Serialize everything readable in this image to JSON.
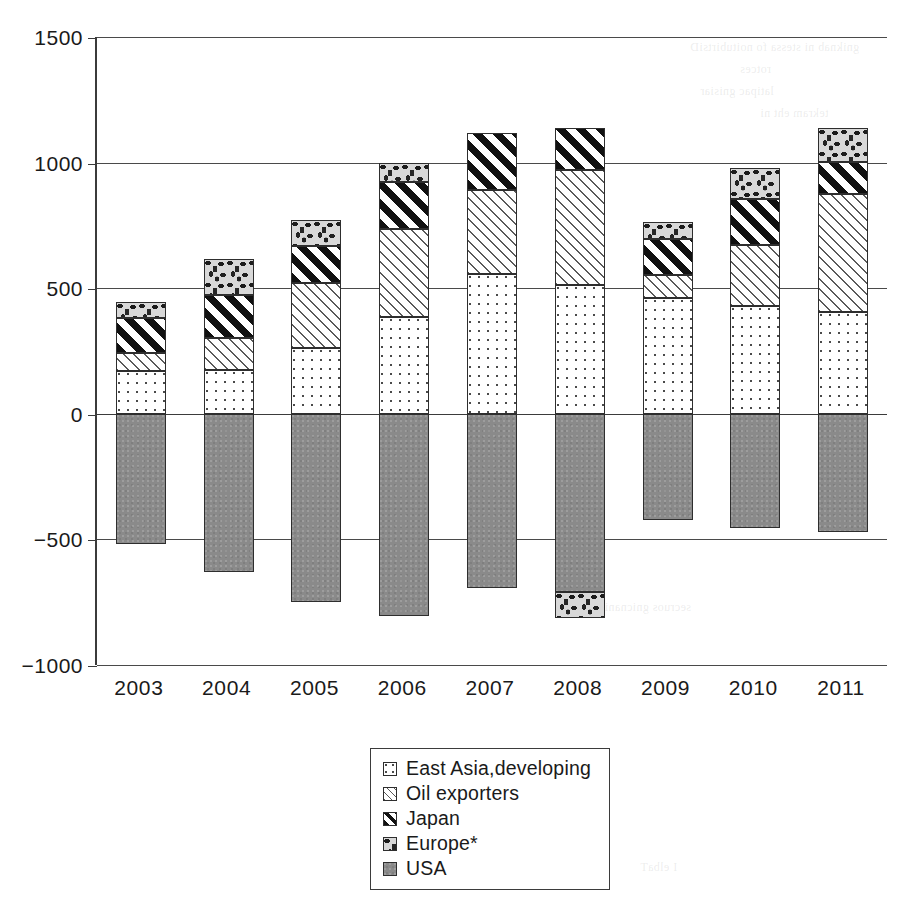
{
  "chart_data": {
    "type": "bar",
    "stacked": true,
    "title": "",
    "xlabel": "",
    "ylabel": "",
    "ylim": [
      -1000,
      1500
    ],
    "ytick_values": [
      1500,
      1000,
      500,
      0,
      -500,
      -1000
    ],
    "ytick_labels": [
      "1500",
      "1000",
      "500",
      "0",
      "−500",
      "−1000"
    ],
    "grid": true,
    "legend_position": "bottom-center",
    "categories": [
      "2003",
      "2004",
      "2005",
      "2006",
      "2007",
      "2008",
      "2009",
      "2010",
      "2011"
    ],
    "series": [
      {
        "name": "East Asia,developing",
        "pattern": "dotted",
        "values": [
          170,
          175,
          260,
          387,
          558,
          514,
          459,
          430,
          406
        ]
      },
      {
        "name": "Oil exporters",
        "pattern": "light-diagonal-hatch",
        "values": [
          72,
          125,
          259,
          349,
          334,
          458,
          92,
          240,
          470
        ]
      },
      {
        "name": "Japan",
        "pattern": "bold-diagonal-hatch",
        "values": [
          139,
          174,
          148,
          187,
          227,
          167,
          143,
          187,
          128
        ]
      },
      {
        "name": "Europe*",
        "pattern": "speckled",
        "values": [
          64,
          144,
          103,
          76,
          0,
          0,
          68,
          123,
          135
        ]
      },
      {
        "name": "USA",
        "pattern": "solid-gray",
        "values": [
          -520,
          -631,
          -748,
          -803,
          -693,
          -709,
          -422,
          -455,
          -470
        ]
      },
      {
        "name": "Europe*-negative",
        "pattern": "speckled",
        "values": [
          0,
          0,
          0,
          0,
          0,
          -104,
          0,
          0,
          0
        ]
      }
    ],
    "legend_entries": [
      "East Asia,developing",
      "Oil exporters",
      "Japan",
      "Europe*",
      "USA"
    ]
  },
  "bleed_text": [
    "gniknab ni stessa fo noitubirtsiD",
    "rotces",
    "latipac gnisiar",
    "tekram eht ni",
    "I elbaT",
    "secruos gnicnanif"
  ]
}
